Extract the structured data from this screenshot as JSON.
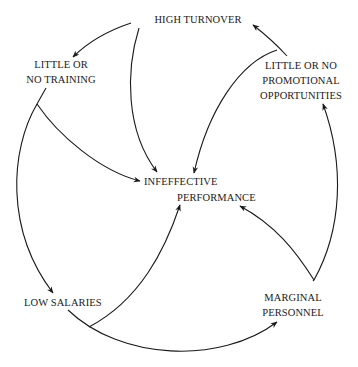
{
  "diagram": {
    "type": "causal-loop",
    "colors": {
      "line": "#1a1a1a",
      "background": "#ffffff"
    },
    "nodes": {
      "high_turnover": {
        "lines": [
          "HIGH TURNOVER"
        ]
      },
      "little_training": {
        "lines": [
          "LITTLE OR",
          "NO TRAINING"
        ]
      },
      "little_promotion": {
        "lines": [
          "LITTLE OR NO",
          "PROMOTIONAL",
          "OPPORTUNITIES"
        ]
      },
      "ineffective_performance": {
        "lines": [
          "INFEFFECTIVE",
          "PERFORMANCE"
        ]
      },
      "low_salaries": {
        "lines": [
          "LOW SALARIES"
        ]
      },
      "marginal_personnel": {
        "lines": [
          "MARGINAL",
          "PERSONNEL"
        ]
      }
    },
    "edges": [
      {
        "from": "HIGH TURNOVER",
        "to": "LITTLE OR NO TRAINING"
      },
      {
        "from": "HIGH TURNOVER",
        "to": "INFEFFECTIVE PERFORMANCE"
      },
      {
        "from": "LITTLE OR NO TRAINING",
        "to": "INFEFFECTIVE PERFORMANCE"
      },
      {
        "from": "LITTLE OR NO TRAINING",
        "to": "LOW SALARIES"
      },
      {
        "from": "LOW SALARIES",
        "to": "INFEFFECTIVE PERFORMANCE"
      },
      {
        "from": "LOW SALARIES",
        "to": "MARGINAL PERSONNEL"
      },
      {
        "from": "MARGINAL PERSONNEL",
        "to": "INFEFFECTIVE PERFORMANCE"
      },
      {
        "from": "MARGINAL PERSONNEL",
        "to": "LITTLE OR NO PROMOTIONAL OPPORTUNITIES"
      },
      {
        "from": "LITTLE OR NO PROMOTIONAL OPPORTUNITIES",
        "to": "HIGH TURNOVER"
      },
      {
        "from": "LITTLE OR NO PROMOTIONAL OPPORTUNITIES",
        "to": "INFEFFECTIVE PERFORMANCE"
      }
    ]
  }
}
